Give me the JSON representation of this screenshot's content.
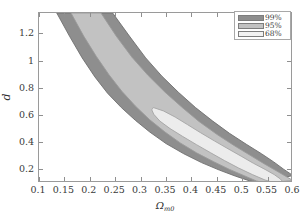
{
  "chart_data": {
    "type": "area",
    "title": "",
    "subtitle": "",
    "xlabel": "Ω",
    "xlabel_sub": "m0",
    "ylabel": "d",
    "xlim": [
      0.1,
      0.6
    ],
    "ylim": [
      0.1,
      1.35
    ],
    "xticks": [
      0.1,
      0.15,
      0.2,
      0.25,
      0.3,
      0.35,
      0.4,
      0.45,
      0.5,
      0.55,
      0.6
    ],
    "xticklabels": [
      "0.1",
      "0.15",
      "0.2",
      "0.25",
      "0.3",
      "0.35",
      "0.4",
      "0.45",
      "0.5",
      "0.55",
      "0.6"
    ],
    "yticks": [
      0.2,
      0.4,
      0.6,
      0.8,
      1.0,
      1.2
    ],
    "yticklabels": [
      "0.2",
      "0.4",
      "0.6",
      "0.8",
      "1",
      "1.2"
    ],
    "grid": false,
    "legend_position": "top-right",
    "series": [
      {
        "name": "99%",
        "label": "99%",
        "color": "#8e8e8e",
        "edge_color": "#6f6f6f",
        "level": 0.99,
        "description": "Outer degenerate banana-shaped confidence band",
        "outer_boundary": [
          [
            0.135,
            1.35
          ],
          [
            0.16,
            1.18
          ],
          [
            0.185,
            1.02
          ],
          [
            0.21,
            0.88
          ],
          [
            0.235,
            0.76
          ],
          [
            0.262,
            0.655
          ],
          [
            0.29,
            0.56
          ],
          [
            0.318,
            0.475
          ],
          [
            0.35,
            0.39
          ],
          [
            0.385,
            0.315
          ],
          [
            0.42,
            0.25
          ],
          [
            0.455,
            0.195
          ],
          [
            0.487,
            0.15
          ],
          [
            0.515,
            0.115
          ],
          [
            0.535,
            0.1
          ]
        ],
        "inner_boundary": [
          [
            0.245,
            1.35
          ],
          [
            0.278,
            1.18
          ],
          [
            0.31,
            1.02
          ],
          [
            0.342,
            0.885
          ],
          [
            0.375,
            0.765
          ],
          [
            0.408,
            0.655
          ],
          [
            0.442,
            0.555
          ],
          [
            0.475,
            0.465
          ],
          [
            0.508,
            0.385
          ],
          [
            0.538,
            0.315
          ],
          [
            0.562,
            0.255
          ],
          [
            0.582,
            0.2
          ],
          [
            0.6,
            0.155
          ]
        ]
      },
      {
        "name": "95%",
        "label": "95%",
        "color": "#c2c2c2",
        "edge_color": "#9a9a9a",
        "level": 0.95,
        "description": "Middle confidence band nested inside the 99% band",
        "outer_boundary": [
          [
            0.163,
            1.35
          ],
          [
            0.188,
            1.18
          ],
          [
            0.213,
            1.03
          ],
          [
            0.238,
            0.895
          ],
          [
            0.263,
            0.775
          ],
          [
            0.29,
            0.665
          ],
          [
            0.318,
            0.565
          ],
          [
            0.348,
            0.475
          ],
          [
            0.378,
            0.395
          ],
          [
            0.41,
            0.322
          ],
          [
            0.443,
            0.258
          ],
          [
            0.475,
            0.2
          ],
          [
            0.505,
            0.152
          ],
          [
            0.528,
            0.115
          ],
          [
            0.545,
            0.1
          ]
        ],
        "inner_boundary": [
          [
            0.222,
            1.35
          ],
          [
            0.252,
            1.18
          ],
          [
            0.283,
            1.025
          ],
          [
            0.315,
            0.89
          ],
          [
            0.348,
            0.768
          ],
          [
            0.382,
            0.655
          ],
          [
            0.415,
            0.552
          ],
          [
            0.45,
            0.458
          ],
          [
            0.483,
            0.378
          ],
          [
            0.515,
            0.305
          ],
          [
            0.543,
            0.242
          ],
          [
            0.568,
            0.188
          ],
          [
            0.59,
            0.14
          ],
          [
            0.6,
            0.118
          ]
        ]
      },
      {
        "name": "68%",
        "label": "68%",
        "color": "#ececec",
        "edge_color": "#a5a5a5",
        "level": 0.68,
        "description": "Innermost elongated 68% confidence region",
        "boundary": [
          [
            0.325,
            0.655
          ],
          [
            0.345,
            0.63
          ],
          [
            0.368,
            0.585
          ],
          [
            0.392,
            0.53
          ],
          [
            0.418,
            0.47
          ],
          [
            0.445,
            0.41
          ],
          [
            0.472,
            0.352
          ],
          [
            0.498,
            0.297
          ],
          [
            0.522,
            0.245
          ],
          [
            0.545,
            0.2
          ],
          [
            0.563,
            0.162
          ],
          [
            0.575,
            0.13
          ],
          [
            0.58,
            0.108
          ],
          [
            0.565,
            0.1
          ],
          [
            0.545,
            0.122
          ],
          [
            0.52,
            0.162
          ],
          [
            0.493,
            0.21
          ],
          [
            0.465,
            0.265
          ],
          [
            0.438,
            0.322
          ],
          [
            0.41,
            0.382
          ],
          [
            0.383,
            0.442
          ],
          [
            0.358,
            0.5
          ],
          [
            0.338,
            0.555
          ],
          [
            0.326,
            0.605
          ],
          [
            0.322,
            0.638
          ]
        ]
      }
    ]
  },
  "legend": {
    "items": [
      {
        "label": "99%",
        "color": "#8e8e8e"
      },
      {
        "label": "95%",
        "color": "#c2c2c2"
      },
      {
        "label": "68%",
        "color": "#f2f2f2"
      }
    ]
  },
  "axes": {
    "x_title_symbol": "Ω",
    "x_title_subscript": "m0",
    "y_title": "d"
  }
}
